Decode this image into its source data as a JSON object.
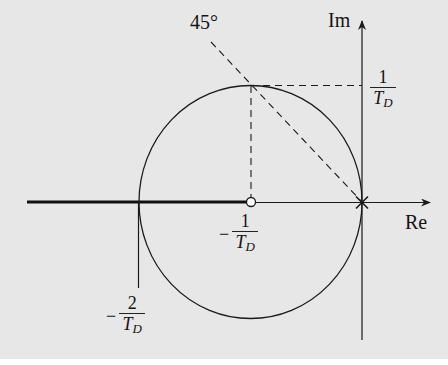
{
  "figure": {
    "type": "root-locus",
    "background_color": "#e7e7e7",
    "line_color": "#1a1a1a"
  },
  "axes": {
    "real_label": "Re",
    "imag_label": "Im"
  },
  "angle_label": "45°",
  "labels": {
    "top_right": {
      "numerator": "1",
      "denominator": "T",
      "subscript": "D",
      "sign": ""
    },
    "center": {
      "numerator": "1",
      "denominator": "T",
      "subscript": "D",
      "sign": "−"
    },
    "left": {
      "numerator": "2",
      "denominator": "T",
      "subscript": "D",
      "sign": "−"
    }
  },
  "markers": {
    "pole": {
      "symbol": "×",
      "position": "origin"
    },
    "zero": {
      "symbol": "○",
      "position": "-1/T_D"
    }
  },
  "features": {
    "circle": "radius 1/T_D centered at -1/T_D",
    "thick_segment": "real axis from -∞ to -1/T_D",
    "dashed_lines": [
      "45° line through origin",
      "vertical at -1/T_D",
      "horizontal at +1/T_D"
    ]
  }
}
